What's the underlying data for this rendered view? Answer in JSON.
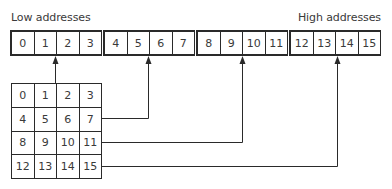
{
  "labels": {
    "low": "Low addresses",
    "high": "High addresses"
  },
  "memory_row": {
    "cells": [
      "0",
      "1",
      "2",
      "3",
      "4",
      "5",
      "6",
      "7",
      "8",
      "9",
      "10",
      "11",
      "12",
      "13",
      "14",
      "15"
    ],
    "groups": [
      [
        0,
        3
      ],
      [
        4,
        7
      ],
      [
        8,
        11
      ],
      [
        12,
        15
      ]
    ]
  },
  "matrix": {
    "rows": [
      [
        "0",
        "1",
        "2",
        "3"
      ],
      [
        "4",
        "5",
        "6",
        "7"
      ],
      [
        "8",
        "9",
        "10",
        "11"
      ],
      [
        "12",
        "13",
        "14",
        "15"
      ]
    ]
  },
  "arrows": [
    {
      "from": "matrix row 0",
      "to": "memory cell 1/2 boundary (group 0)"
    },
    {
      "from": "matrix row 1",
      "to": "memory cell 5/6 boundary (group 1)"
    },
    {
      "from": "matrix row 2",
      "to": "memory cell 9/10 boundary (group 2)"
    },
    {
      "from": "matrix row 3",
      "to": "memory cell 13/14 boundary (group 3)"
    }
  ],
  "colors": {
    "line": "#2a2a2a",
    "text": "#3a3a3a",
    "background": "#ffffff"
  }
}
